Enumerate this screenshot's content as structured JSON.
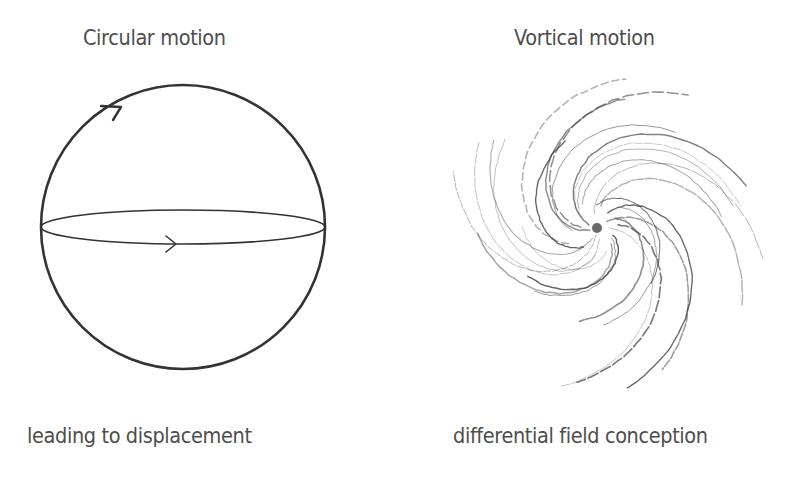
{
  "panels": [
    {
      "title": "Circular motion",
      "caption": "leading to displacement",
      "figure": "sphere with equator ellipse and directional arrows"
    },
    {
      "title": "Vortical motion",
      "caption": "differential field conception",
      "figure": "hand-drawn spiral vortex"
    }
  ],
  "colors": {
    "text": "#4d4d4d",
    "stroke": "#333333",
    "sketch": "#555555",
    "background": "#ffffff"
  }
}
